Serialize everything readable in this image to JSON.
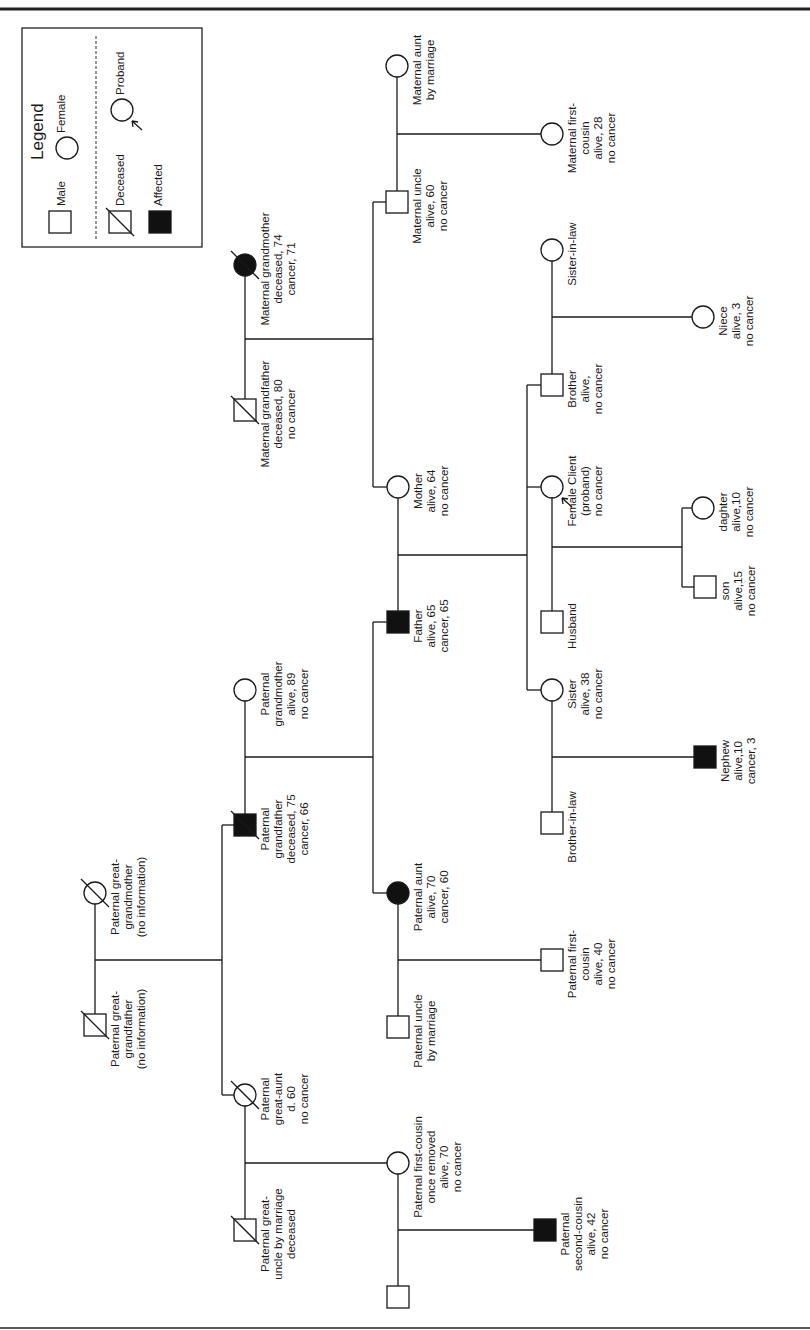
{
  "figure": {
    "type": "family pedigree (rotated 90 degrees)",
    "orientation": "rotated counter-clockwise; text reads bottom-to-top"
  },
  "legend": {
    "title": "Legend",
    "items": [
      {
        "symbol": "square",
        "label": "Male"
      },
      {
        "symbol": "circle",
        "label": "Female"
      },
      {
        "symbol": "square-slash",
        "label": "Deceased"
      },
      {
        "symbol": "circle-arrow",
        "label": "Proband"
      },
      {
        "symbol": "filled-square",
        "label": "Affected"
      }
    ]
  },
  "individuals": [
    {
      "id": "pggf",
      "sex": "male",
      "x": 95,
      "y": 1025,
      "deceased": true,
      "affected": false,
      "lines": [
        "Paternal great-",
        "grandfather",
        "(no information)"
      ]
    },
    {
      "id": "pggm",
      "sex": "female",
      "x": 95,
      "y": 893,
      "deceased": true,
      "affected": false,
      "lines": [
        "Paternal great-",
        "grandmother",
        "(no information)"
      ]
    },
    {
      "id": "pgf",
      "sex": "male",
      "x": 245,
      "y": 825,
      "deceased": true,
      "affected": true,
      "lines": [
        "Paternal",
        "grandfather",
        "deceased, 75",
        "cancer, 66"
      ]
    },
    {
      "id": "pgm",
      "sex": "female",
      "x": 245,
      "y": 690,
      "deceased": false,
      "affected": false,
      "lines": [
        "Paternal",
        "grandmother",
        "alive, 89",
        "no cancer"
      ]
    },
    {
      "id": "pga",
      "sex": "female",
      "x": 245,
      "y": 1095,
      "deceased": true,
      "affected": false,
      "lines": [
        "Paternal",
        "great-aunt",
        "d. 60",
        "no cancer"
      ]
    },
    {
      "id": "pgu",
      "sex": "male",
      "x": 245,
      "y": 1230,
      "deceased": true,
      "affected": false,
      "lines": [
        "Paternal great-",
        "uncle by marriage",
        "deceased"
      ]
    },
    {
      "id": "mgf",
      "sex": "male",
      "x": 245,
      "y": 410,
      "deceased": true,
      "affected": false,
      "lines": [
        "Maternal grandfather",
        "deceased, 80",
        "no cancer"
      ]
    },
    {
      "id": "mgm",
      "sex": "female",
      "x": 245,
      "y": 265,
      "deceased": true,
      "affected": true,
      "lines": [
        "Maternal grandmother",
        "deceased, 74",
        "cancer, 71"
      ]
    },
    {
      "id": "mu",
      "sex": "male",
      "x": 397,
      "y": 202,
      "deceased": false,
      "affected": false,
      "lines": [
        "Maternal uncle",
        "alive, 60",
        "no cancer"
      ]
    },
    {
      "id": "mam",
      "sex": "female",
      "x": 397,
      "y": 66,
      "deceased": false,
      "affected": false,
      "lines": [
        "Maternal aunt",
        "by marriage"
      ]
    },
    {
      "id": "mother",
      "sex": "female",
      "x": 398,
      "y": 487,
      "deceased": false,
      "affected": false,
      "lines": [
        "Mother",
        "alive, 64",
        "no cancer"
      ]
    },
    {
      "id": "father",
      "sex": "male",
      "x": 398,
      "y": 622,
      "deceased": false,
      "affected": true,
      "lines": [
        "Father",
        "alive, 65",
        "cancer, 65"
      ]
    },
    {
      "id": "paunt",
      "sex": "female",
      "x": 398,
      "y": 893,
      "deceased": false,
      "affected": true,
      "lines": [
        "Paternal aunt",
        "alive, 70",
        "cancer, 60"
      ]
    },
    {
      "id": "pum",
      "sex": "male",
      "x": 398,
      "y": 1027,
      "deceased": false,
      "affected": false,
      "lines": [
        "Paternal uncle",
        "by marriage"
      ]
    },
    {
      "id": "pfcor",
      "sex": "female",
      "x": 398,
      "y": 1163,
      "deceased": false,
      "affected": false,
      "lines": [
        "Paternal first-cousin",
        "once removed",
        "alive, 70",
        "no cancer"
      ]
    },
    {
      "id": "pfcor_sp",
      "sex": "male",
      "x": 398,
      "y": 1297,
      "deceased": false,
      "affected": false,
      "lines": []
    },
    {
      "id": "mfc",
      "sex": "female",
      "x": 552,
      "y": 134,
      "deceased": false,
      "affected": false,
      "lines": [
        "Maternal first-",
        "cousin",
        "alive, 28",
        "no cancer"
      ]
    },
    {
      "id": "sil",
      "sex": "female",
      "x": 552,
      "y": 250,
      "deceased": false,
      "affected": false,
      "lines": [
        "Sister-in-law"
      ]
    },
    {
      "id": "brother",
      "sex": "male",
      "x": 552,
      "y": 385,
      "deceased": false,
      "affected": false,
      "lines": [
        "Brother",
        "alive,",
        "no cancer"
      ]
    },
    {
      "id": "proband",
      "sex": "female",
      "x": 552,
      "y": 487,
      "deceased": false,
      "affected": false,
      "proband": true,
      "lines": [
        "Female Client",
        "(proband)",
        "no cancer"
      ]
    },
    {
      "id": "husband",
      "sex": "male",
      "x": 552,
      "y": 622,
      "deceased": false,
      "affected": false,
      "lines": [
        "Husband"
      ]
    },
    {
      "id": "sister",
      "sex": "female",
      "x": 552,
      "y": 690,
      "deceased": false,
      "affected": false,
      "lines": [
        "Sister",
        "alive, 38",
        "no cancer"
      ]
    },
    {
      "id": "bil",
      "sex": "male",
      "x": 552,
      "y": 823,
      "deceased": false,
      "affected": false,
      "lines": [
        "Brother-in-law"
      ]
    },
    {
      "id": "pfc",
      "sex": "male",
      "x": 552,
      "y": 960,
      "deceased": false,
      "affected": false,
      "lines": [
        "Paternal first-",
        "cousin",
        "alive, 40",
        "no cancer"
      ]
    },
    {
      "id": "psc",
      "sex": "male",
      "x": 545,
      "y": 1230,
      "deceased": false,
      "affected": true,
      "lines": [
        "Paternal",
        "second-cousin",
        "alive, 42",
        "no cancer"
      ]
    },
    {
      "id": "niece",
      "sex": "female",
      "x": 703,
      "y": 317,
      "deceased": false,
      "affected": false,
      "lines": [
        "Niece",
        "alive, 3",
        "no cancer"
      ]
    },
    {
      "id": "daughter",
      "sex": "female",
      "x": 703,
      "y": 508,
      "deceased": false,
      "affected": false,
      "lines": [
        "daghter",
        "alive,10",
        "no cancer"
      ]
    },
    {
      "id": "son",
      "sex": "male",
      "x": 705,
      "y": 587,
      "deceased": false,
      "affected": false,
      "lines": [
        "son",
        "alive,15",
        "no cancer"
      ]
    },
    {
      "id": "nephew",
      "sex": "male",
      "x": 705,
      "y": 757,
      "deceased": false,
      "affected": true,
      "lines": [
        "Nephew",
        "alive,10",
        "cancer, 3"
      ]
    }
  ],
  "connectors": [
    [
      95,
      893,
      95,
      1025
    ],
    [
      95,
      960,
      222,
      960
    ],
    [
      222,
      825,
      222,
      1095
    ],
    [
      222,
      825,
      245,
      825
    ],
    [
      222,
      1095,
      245,
      1095
    ],
    [
      245,
      690,
      245,
      825
    ],
    [
      245,
      757,
      373,
      757
    ],
    [
      373,
      622,
      373,
      893
    ],
    [
      373,
      622,
      398,
      622
    ],
    [
      373,
      893,
      398,
      893
    ],
    [
      245,
      1095,
      245,
      1230
    ],
    [
      245,
      1163,
      398,
      1163
    ],
    [
      245,
      265,
      245,
      410
    ],
    [
      245,
      339,
      373,
      339
    ],
    [
      373,
      202,
      373,
      487
    ],
    [
      373,
      202,
      397,
      202
    ],
    [
      373,
      487,
      398,
      487
    ],
    [
      397,
      66,
      397,
      202
    ],
    [
      397,
      134,
      552,
      134
    ],
    [
      398,
      487,
      398,
      622
    ],
    [
      398,
      555,
      527,
      555
    ],
    [
      527,
      385,
      527,
      690
    ],
    [
      527,
      385,
      552,
      385
    ],
    [
      527,
      487,
      552,
      487
    ],
    [
      527,
      690,
      552,
      690
    ],
    [
      398,
      893,
      398,
      1027
    ],
    [
      398,
      960,
      552,
      960
    ],
    [
      398,
      1163,
      398,
      1297
    ],
    [
      398,
      1230,
      545,
      1230
    ],
    [
      552,
      250,
      552,
      385
    ],
    [
      552,
      317,
      703,
      317
    ],
    [
      552,
      487,
      552,
      622
    ],
    [
      552,
      547,
      682,
      547
    ],
    [
      682,
      508,
      682,
      587
    ],
    [
      682,
      508,
      703,
      508
    ],
    [
      682,
      587,
      705,
      587
    ],
    [
      552,
      690,
      552,
      823
    ],
    [
      552,
      757,
      705,
      757
    ]
  ]
}
